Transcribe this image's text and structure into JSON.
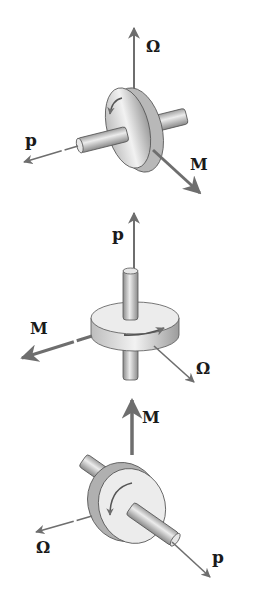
{
  "figures": [
    {
      "name": "gyro-1",
      "labels": {
        "omega": "Ω",
        "p": "p",
        "M": "M"
      },
      "description": "Disk with horizontal shaft; Ω up, p left-down, M right-down"
    },
    {
      "name": "gyro-2",
      "labels": {
        "omega": "Ω",
        "p": "p",
        "M": "M"
      },
      "description": "Disk with vertical shaft; p up, M left, Ω right-down"
    },
    {
      "name": "gyro-3",
      "labels": {
        "omega": "Ω",
        "p": "p",
        "M": "M"
      },
      "description": "Disk with shaft; M up, Ω left, p right-down"
    }
  ],
  "colors": {
    "arrow": "#6e6e6e",
    "disk": "#dcdcdc",
    "disk_shade": "#a8a8a8",
    "text": "#1a1a1a"
  }
}
